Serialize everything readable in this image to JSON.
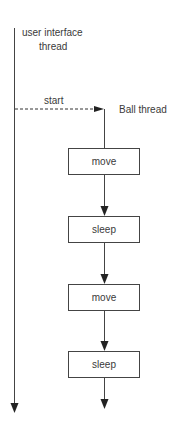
{
  "diagram": {
    "ui_thread": {
      "label_line1": "user interface",
      "label_line2": "thread"
    },
    "start_label": "start",
    "ball_thread_label": "Ball thread",
    "steps": [
      {
        "label": "move"
      },
      {
        "label": "sleep"
      },
      {
        "label": "move"
      },
      {
        "label": "sleep"
      }
    ],
    "colors": {
      "line": "#333333",
      "text": "#3a3a3a",
      "background": "#ffffff"
    }
  }
}
